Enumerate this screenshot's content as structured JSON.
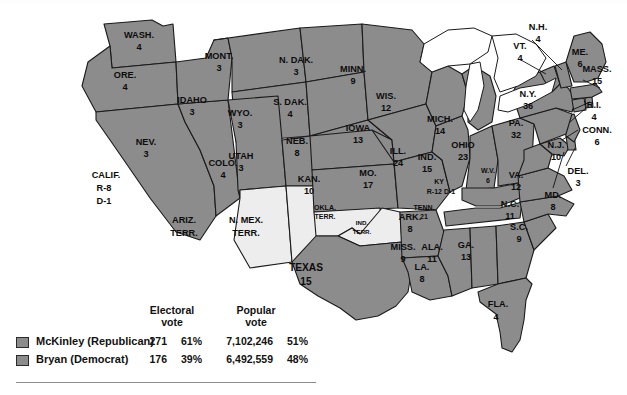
{
  "figure": {
    "name": "1896-presidential-election-electoral-map",
    "colors": {
      "state_fill": "#8c8c8c",
      "territory_fill": "#ededed",
      "lake_fill": "#ffffff",
      "outline": "#1a1a1a",
      "background": "#ffffff"
    }
  },
  "legend": {
    "column_headers": {
      "electoral": "Electoral\nvote",
      "electoral_line1": "Electoral",
      "electoral_line2": "vote",
      "popular_line1": "Popular",
      "popular_line2": "vote"
    },
    "rows": [
      {
        "candidate": "McKinley  (Republican)",
        "electoral_votes": "271",
        "electoral_pct": "61%",
        "popular_votes": "7,102,246",
        "popular_pct": "51%",
        "swatch_color": "#8c8c8c"
      },
      {
        "candidate": "Bryan (Democrat)",
        "electoral_votes": "176",
        "electoral_pct": "39%",
        "popular_votes": "6,492,559",
        "popular_pct": "48%",
        "swatch_color": "#8c8c8c"
      }
    ]
  },
  "map_labels": {
    "wash": {
      "name": "WASH.",
      "votes": "4"
    },
    "ore": {
      "name": "ORE.",
      "votes": "4"
    },
    "calif": {
      "name": "CALIF.",
      "line2": "R-8",
      "line3": "D-1"
    },
    "nev": {
      "name": "NEV.",
      "votes": "3"
    },
    "idaho": {
      "name": "IDAHO",
      "votes": "3"
    },
    "mont": {
      "name": "MONT.",
      "votes": "3"
    },
    "wyo": {
      "name": "WYO.",
      "votes": "3"
    },
    "utah": {
      "name": "UTAH",
      "votes": "3"
    },
    "colo": {
      "name": "COLO.",
      "votes": "4"
    },
    "ariz": {
      "name": "ARIZ.",
      "line2": "TERR."
    },
    "nmex": {
      "name": "N. MEX.",
      "line2": "TERR."
    },
    "ndak": {
      "name": "N. DAK.",
      "votes": "3"
    },
    "sdak": {
      "name": "S. DAK.",
      "votes": "4"
    },
    "neb": {
      "name": "NEB.",
      "votes": "8"
    },
    "kan": {
      "name": "KAN.",
      "votes": "10"
    },
    "okla": {
      "name": "OKLA.",
      "line2": "TERR."
    },
    "ind_terr": {
      "name": "IND.",
      "line2": "TERR."
    },
    "texas": {
      "name": "TEXAS",
      "votes": "15"
    },
    "minn": {
      "name": "MINN.",
      "votes": "9"
    },
    "iowa": {
      "name": "IOWA",
      "votes": "13"
    },
    "mo": {
      "name": "MO.",
      "votes": "17"
    },
    "ark": {
      "name": "ARK.",
      "votes": "8"
    },
    "la": {
      "name": "LA.",
      "votes": "8"
    },
    "wis": {
      "name": "WIS.",
      "votes": "12"
    },
    "ill": {
      "name": "ILL.",
      "votes": "24"
    },
    "mich": {
      "name": "MICH.",
      "votes": "14"
    },
    "ind": {
      "name": "IND.",
      "votes": "15"
    },
    "ohio": {
      "name": "OHIO",
      "votes": "23"
    },
    "ky": {
      "name": "KY",
      "line2": "R-12 D-1"
    },
    "tenn": {
      "name": "TENN.",
      "votes": "21"
    },
    "miss": {
      "name": "MISS.",
      "votes": "9"
    },
    "ala": {
      "name": "ALA.",
      "votes": "11"
    },
    "ga": {
      "name": "GA.",
      "votes": "13"
    },
    "fla": {
      "name": "FLA.",
      "votes": "4"
    },
    "sc": {
      "name": "S.C.",
      "votes": "9"
    },
    "nc": {
      "name": "N.C.",
      "votes": "11"
    },
    "va": {
      "name": "VA.",
      "votes": "12"
    },
    "wv": {
      "name": "W.V.",
      "votes": "6"
    },
    "md": {
      "name": "MD.",
      "votes": "8"
    },
    "del": {
      "name": "DEL.",
      "votes": "3"
    },
    "nj": {
      "name": "N.J.",
      "votes": "10"
    },
    "pa": {
      "name": "PA.",
      "votes": "32"
    },
    "ny": {
      "name": "N.Y.",
      "votes": "36"
    },
    "conn": {
      "name": "CONN.",
      "votes": "6"
    },
    "ri": {
      "name": "R.I.",
      "votes": "4"
    },
    "mass": {
      "name": "MASS.",
      "votes": "15"
    },
    "vt": {
      "name": "VT.",
      "votes": "4"
    },
    "nh": {
      "name": "N.H.",
      "votes": "4"
    },
    "me": {
      "name": "ME.",
      "votes": "6"
    }
  }
}
